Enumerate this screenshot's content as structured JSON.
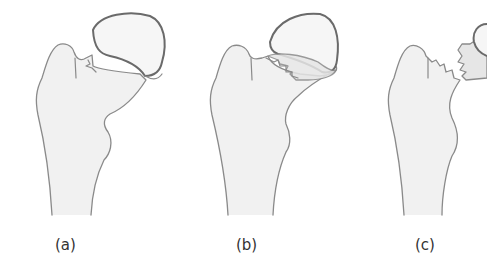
{
  "figure": {
    "panels": [
      {
        "label": "(a)",
        "fracture_type": "subcapital fracture, head slightly angulated"
      },
      {
        "label": "(b)",
        "fracture_type": "transcervical fracture with zig-zag line"
      },
      {
        "label": "(c)",
        "fracture_type": "displaced fracture, head separated"
      }
    ]
  },
  "colors": {
    "outline": "#8a8a8a",
    "head_outline": "#6a6a6a",
    "bone_fill": "#f1f1f1",
    "background": "#ffffff"
  }
}
